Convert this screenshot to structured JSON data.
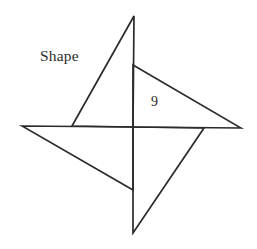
{
  "figure": {
    "background_color": "#ffffff",
    "stroke_color": "#2b2b2b",
    "stroke_width": 1.7,
    "width": 257,
    "height": 249,
    "labels": [
      {
        "id": "shape",
        "text": "Shape",
        "x": 40,
        "y": 48,
        "font_size": 15.5
      },
      {
        "id": "nine",
        "text": "9",
        "x": 151,
        "y": 95,
        "font_size": 14
      }
    ],
    "center": {
      "x": 133,
      "y": 127
    },
    "tips": {
      "top": {
        "x": 134,
        "y": 16
      },
      "right": {
        "x": 241,
        "y": 128
      },
      "bottom": {
        "x": 133,
        "y": 233
      },
      "left": {
        "x": 22,
        "y": 126
      }
    },
    "paths": [
      {
        "id": "triangle-top-left",
        "name": "upper-left-triangle",
        "d": "M 134 16 L 133 127 L 72 126 Z"
      },
      {
        "id": "triangle-top-right",
        "name": "upper-right-triangle",
        "d": "M 241 128 L 133 127 L 133 65 Z"
      },
      {
        "id": "triangle-bottom-right",
        "name": "lower-right-triangle",
        "d": "M 133 233 L 133 127 L 204 128 Z"
      },
      {
        "id": "triangle-bottom-left",
        "name": "lower-left-triangle",
        "d": "M 22 126 L 133 127 L 133 190 Z"
      }
    ]
  },
  "chart_data": {
    "type": "diagram",
    "shape": "pinwheel",
    "title": "Shape",
    "annotations": [
      {
        "label": "Shape",
        "value": null
      },
      {
        "label": "side",
        "value": 9
      }
    ],
    "components": 4,
    "component_type": "right triangle",
    "symmetry": "4-fold rotational",
    "labeled_length": 9
  }
}
